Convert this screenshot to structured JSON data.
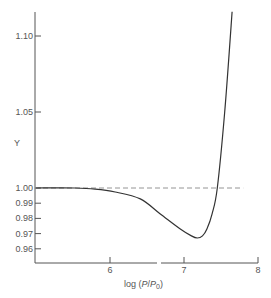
{
  "chart_data": {
    "type": "line",
    "title": "",
    "xlabel": "log (P/P0)",
    "ylabel": "Y",
    "xlim": [
      5.0,
      8.0
    ],
    "ylim": [
      0.955,
      1.115
    ],
    "grid": false,
    "legend": null,
    "x_ticks": [
      6,
      7,
      8
    ],
    "x_tick_labels": [
      "6",
      "7",
      "8"
    ],
    "y_ticks": [
      0.96,
      0.97,
      0.98,
      0.99,
      1.0,
      1.05,
      1.1
    ],
    "y_tick_labels": [
      "0.96",
      "0.97",
      "0.98",
      "0.99",
      "1.00",
      "1.05",
      "1.10"
    ],
    "reference_line": {
      "y": 1.0,
      "style": "dashed",
      "x_range": [
        5.0,
        7.8
      ]
    },
    "series": [
      {
        "name": "Y",
        "x": [
          5.0,
          5.53,
          5.8,
          6.07,
          6.41,
          6.68,
          6.95,
          7.1,
          7.18,
          7.25,
          7.31,
          7.38,
          7.45,
          7.55,
          7.65
        ],
        "y": [
          1.0,
          1.0,
          0.9993,
          0.9974,
          0.9928,
          0.9829,
          0.973,
          0.9685,
          0.9671,
          0.9685,
          0.973,
          0.983,
          1.0,
          1.05,
          1.116
        ]
      }
    ]
  },
  "labels": {
    "y_axis": "Y",
    "x_axis_main": "log (",
    "x_axis_P": "P",
    "x_axis_slash": "/",
    "x_axis_P0": "P",
    "x_axis_sub": "0",
    "x_axis_close": ")"
  }
}
